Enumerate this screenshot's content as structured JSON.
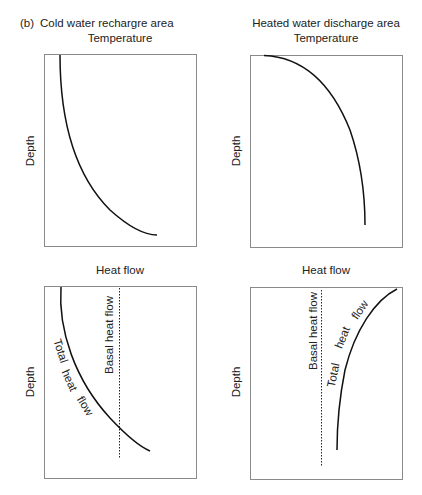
{
  "figure": {
    "panel_label": "(b)",
    "columns": [
      {
        "title": "Cold water rechargre area"
      },
      {
        "title": "Heated water discharge area"
      }
    ],
    "panels": [
      {
        "id": "cold-temperature",
        "x_label": "Temperature",
        "y_label": "Depth",
        "curves": [
          {
            "name": "Temperature profile",
            "style": "solid"
          }
        ]
      },
      {
        "id": "hot-temperature",
        "x_label": "Temperature",
        "y_label": "Depth",
        "curves": [
          {
            "name": "Temperature profile",
            "style": "solid"
          }
        ]
      },
      {
        "id": "cold-heatflow",
        "x_label": "Heat flow",
        "y_label": "Depth",
        "curves": [
          {
            "name": "Total heat flow",
            "style": "solid",
            "label_words": [
              "Total",
              "heat",
              "flow"
            ]
          },
          {
            "name": "Basal heat flow",
            "style": "dotted"
          }
        ]
      },
      {
        "id": "hot-heatflow",
        "x_label": "Heat flow",
        "y_label": "Depth",
        "curves": [
          {
            "name": "Total heat flow",
            "style": "solid",
            "label_words": [
              "Total",
              "heat",
              "flow"
            ]
          },
          {
            "name": "Basal heat flow",
            "style": "dotted"
          }
        ]
      }
    ]
  },
  "colors": {
    "frame": "#8a8a8a",
    "curve": "#111111",
    "text": "#222222"
  }
}
